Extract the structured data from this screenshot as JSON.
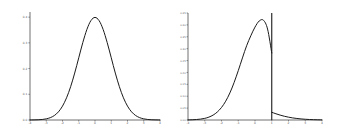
{
  "figure": {
    "background_color": "#ffffff",
    "axis_color": "#4d4d4d",
    "curve_color": "#1a1a1a",
    "panel_count": 2
  },
  "chart_data": [
    {
      "type": "line",
      "title": "",
      "subtitle": "",
      "xlabel": "",
      "ylabel": "",
      "grid": false,
      "legend": null,
      "xlim": [
        -4,
        4
      ],
      "ylim": [
        0,
        0.42
      ],
      "xticks": [
        -4,
        -3,
        -2,
        -1,
        0,
        1,
        2,
        3,
        4
      ],
      "xticklabels": [
        "-4",
        "-3",
        "-2",
        "-1",
        "0",
        "1",
        "2",
        "3",
        "4"
      ],
      "yticks": [
        0,
        0.1,
        0.2,
        0.3,
        0.4
      ],
      "yticklabels": [
        "0.0",
        "0.1",
        "0.2",
        "0.3",
        "0.4"
      ],
      "series": [
        {
          "name": "standard normal pdf",
          "x": [
            -4,
            -3.75,
            -3.5,
            -3.25,
            -3,
            -2.75,
            -2.5,
            -2.25,
            -2,
            -1.75,
            -1.5,
            -1.25,
            -1,
            -0.75,
            -0.5,
            -0.25,
            0,
            0.25,
            0.5,
            0.75,
            1,
            1.25,
            1.5,
            1.75,
            2,
            2.25,
            2.5,
            2.75,
            3,
            3.25,
            3.5,
            3.75,
            4
          ],
          "y": [
            0.0001,
            0.0004,
            0.0009,
            0.002,
            0.0044,
            0.0091,
            0.0175,
            0.0317,
            0.054,
            0.0863,
            0.1295,
            0.1826,
            0.242,
            0.3011,
            0.3521,
            0.3867,
            0.3989,
            0.3867,
            0.3521,
            0.3011,
            0.242,
            0.1826,
            0.1295,
            0.0863,
            0.054,
            0.0317,
            0.0175,
            0.0091,
            0.0044,
            0.002,
            0.0009,
            0.0004,
            0.0001
          ]
        }
      ]
    },
    {
      "type": "line",
      "title": "",
      "subtitle": "",
      "xlabel": "",
      "ylabel": "",
      "grid": false,
      "legend": null,
      "xlim": [
        -4,
        4
      ],
      "ylim": [
        0,
        0.45
      ],
      "xticks": [
        -4,
        -3,
        -2,
        -1,
        0,
        1,
        2,
        3,
        4
      ],
      "xticklabels": [
        "-4",
        "-3",
        "-2",
        "-1",
        "0",
        "1",
        "2",
        "3",
        "4"
      ],
      "yticks": [
        0,
        0.05,
        0.1,
        0.15,
        0.2,
        0.25,
        0.3,
        0.35,
        0.4,
        0.45
      ],
      "yticklabels": [
        "0.00",
        "0.05",
        "0.10",
        "0.15",
        "0.20",
        "0.25",
        "0.30",
        "0.35",
        "0.40",
        "0.45"
      ],
      "annotations": [
        {
          "name": "threshold-vertical-line",
          "type": "vline",
          "x": 1.0,
          "y_bottom": 0.0,
          "y_top": 0.45
        }
      ],
      "series": [
        {
          "name": "truncated density left branch",
          "x": [
            -4,
            -3.75,
            -3.5,
            -3.25,
            -3,
            -2.75,
            -2.5,
            -2.25,
            -2,
            -1.75,
            -1.5,
            -1.25,
            -1,
            -0.75,
            -0.5,
            -0.25,
            0,
            0.25,
            0.5,
            0.75,
            1
          ],
          "y": [
            0.0005,
            0.001,
            0.002,
            0.0038,
            0.0069,
            0.0122,
            0.0207,
            0.0337,
            0.0527,
            0.0791,
            0.1139,
            0.1571,
            0.2074,
            0.2611,
            0.3124,
            0.3541,
            0.3908,
            0.4163,
            0.4198,
            0.3826,
            0.2818
          ]
        },
        {
          "name": "truncated density right branch",
          "x": [
            1,
            1.25,
            1.5,
            1.75,
            2,
            2.25,
            2.5,
            2.75,
            3,
            3.25,
            3.5,
            3.75,
            4
          ],
          "y": [
            0.0325,
            0.0262,
            0.0206,
            0.0158,
            0.0119,
            0.0088,
            0.0064,
            0.0045,
            0.0031,
            0.0021,
            0.0014,
            0.0009,
            0.0006
          ]
        }
      ]
    }
  ]
}
